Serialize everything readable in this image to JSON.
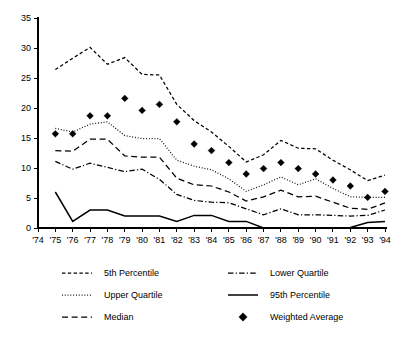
{
  "chart_data": {
    "type": "line",
    "title": "",
    "subtitle": "",
    "xlabel": "",
    "ylabel": "",
    "grid": false,
    "legend_position": "bottom",
    "x": [
      "'74",
      "'75",
      "'76",
      "'77",
      "'78",
      "'79",
      "'80",
      "'81",
      "'82",
      "'83",
      "'84",
      "'85",
      "'86",
      "'87",
      "'88",
      "'89",
      "'90",
      "'91",
      "'92",
      "'93",
      "'94"
    ],
    "xticklabels": [
      "'74",
      "'75",
      "'76",
      "'77",
      "'78",
      "'79",
      "'80",
      "'81",
      "'82",
      "'83",
      "'84",
      "'85",
      "'86",
      "'87",
      "'88",
      "'89",
      "'90",
      "'91",
      "'92",
      "'93",
      "'94"
    ],
    "yticklabels": [
      "0",
      "5",
      "10",
      "15",
      "20",
      "25",
      "30",
      "35"
    ],
    "yticks": [
      0,
      5,
      10,
      15,
      20,
      25,
      30,
      35
    ],
    "ylim": [
      0,
      35
    ],
    "xlim": [
      "'74",
      "'94"
    ],
    "series": [
      {
        "name": "5th Percentile",
        "style": "dashed",
        "x": [
          "'75",
          "'76",
          "'77",
          "'78",
          "'79",
          "'80",
          "'81",
          "'82",
          "'83",
          "'84",
          "'85",
          "'86",
          "'87",
          "'88",
          "'89",
          "'90",
          "'91",
          "'92",
          "'93",
          "'94"
        ],
        "values": [
          26.4,
          28.3,
          30.1,
          27.3,
          28.4,
          25.6,
          25.5,
          20.6,
          17.9,
          16.0,
          13.6,
          11.0,
          12.2,
          14.6,
          13.3,
          13.2,
          11.3,
          9.7,
          7.9,
          8.8
        ]
      },
      {
        "name": "Upper Quartile",
        "style": "dotted",
        "x": [
          "'75",
          "'76",
          "'77",
          "'78",
          "'79",
          "'80",
          "'81",
          "'82",
          "'83",
          "'84",
          "'85",
          "'86",
          "'87",
          "'88",
          "'89",
          "'90",
          "'91",
          "'92",
          "'93",
          "'94"
        ],
        "values": [
          16.6,
          16.0,
          17.3,
          17.7,
          15.4,
          14.9,
          14.9,
          11.3,
          10.3,
          9.7,
          8.2,
          6.1,
          7.2,
          8.5,
          7.2,
          8.2,
          6.6,
          5.2,
          5.1,
          5.1
        ]
      },
      {
        "name": "Median",
        "style": "dashed-long",
        "x": [
          "'75",
          "'76",
          "'77",
          "'78",
          "'79",
          "'80",
          "'81",
          "'82",
          "'83",
          "'84",
          "'85",
          "'86",
          "'87",
          "'88",
          "'89",
          "'90",
          "'91",
          "'92",
          "'93",
          "'94"
        ],
        "values": [
          12.9,
          12.8,
          14.8,
          14.8,
          12.0,
          11.8,
          11.8,
          8.3,
          7.2,
          7.0,
          6.0,
          4.5,
          5.2,
          6.3,
          5.2,
          5.3,
          4.3,
          3.3,
          3.1,
          4.2
        ]
      },
      {
        "name": "Lower Quartile",
        "style": "dash-dot",
        "x": [
          "'75",
          "'76",
          "'77",
          "'78",
          "'79",
          "'80",
          "'81",
          "'82",
          "'83",
          "'84",
          "'85",
          "'86",
          "'87",
          "'88",
          "'89",
          "'90",
          "'91",
          "'92",
          "'93",
          "'94"
        ],
        "values": [
          11.1,
          9.8,
          10.8,
          10.1,
          9.4,
          9.8,
          8.1,
          5.6,
          4.6,
          4.3,
          4.2,
          3.2,
          2.2,
          3.2,
          2.2,
          2.2,
          2.1,
          2.0,
          2.1,
          3.0
        ]
      },
      {
        "name": "95th Percentile",
        "style": "solid",
        "x": [
          "'75",
          "'76",
          "'77",
          "'78",
          "'79",
          "'80",
          "'81",
          "'82",
          "'83",
          "'84",
          "'85",
          "'86",
          "'87",
          "'88",
          "'89",
          "'90",
          "'91",
          "'92",
          "'93",
          "'94"
        ],
        "values": [
          6.0,
          1.1,
          3.0,
          3.0,
          2.0,
          2.0,
          2.0,
          1.1,
          2.1,
          2.1,
          1.1,
          1.1,
          0.0,
          0.0,
          0.0,
          0.0,
          0.0,
          0.1,
          0.9,
          1.1
        ]
      },
      {
        "name": "Weighted Average",
        "style": "markers",
        "marker": "diamond",
        "x": [
          "'75",
          "'76",
          "'77",
          "'78",
          "'79",
          "'80",
          "'81",
          "'82",
          "'83",
          "'84",
          "'85",
          "'86",
          "'87",
          "'88",
          "'89",
          "'90",
          "'91",
          "'92",
          "'93",
          "'94"
        ],
        "values": [
          15.7,
          15.7,
          18.7,
          18.7,
          21.6,
          19.6,
          20.6,
          17.7,
          14.0,
          12.9,
          10.9,
          9.0,
          9.9,
          10.9,
          9.9,
          9.0,
          8.0,
          7.0,
          5.1,
          6.1
        ]
      }
    ]
  },
  "legend": {
    "entries": [
      {
        "label": "5th Percentile",
        "style": "dashed",
        "column": 0,
        "row": 0
      },
      {
        "label": "Upper Quartile",
        "style": "dotted",
        "column": 0,
        "row": 1
      },
      {
        "label": "Median",
        "style": "dashed-long",
        "column": 0,
        "row": 2
      },
      {
        "label": "Lower Quartile",
        "style": "dash-dot",
        "column": 1,
        "row": 0
      },
      {
        "label": "95th Percentile",
        "style": "solid",
        "column": 1,
        "row": 1
      },
      {
        "label": "Weighted Average",
        "style": "markers",
        "column": 1,
        "row": 2
      }
    ]
  },
  "colors": {
    "ink": "#000000",
    "background": "#ffffff"
  }
}
